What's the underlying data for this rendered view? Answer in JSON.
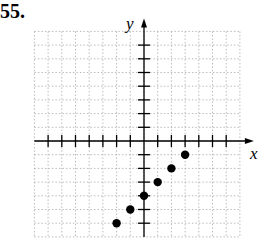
{
  "problem": {
    "number": "55."
  },
  "chart_data": {
    "type": "scatter",
    "title": "",
    "xlabel": "x",
    "ylabel": "y",
    "grid": true,
    "xlim": [
      -8,
      7
    ],
    "ylim": [
      -7,
      8
    ],
    "x": [
      -2,
      -1,
      0,
      1,
      2,
      3
    ],
    "y": [
      -6,
      -5,
      -4,
      -3,
      -2,
      -1
    ],
    "series": [
      {
        "name": "points",
        "x": [
          -2,
          -1,
          0,
          1,
          2,
          3
        ],
        "y": [
          -6,
          -5,
          -4,
          -3,
          -2,
          -1
        ]
      }
    ]
  }
}
